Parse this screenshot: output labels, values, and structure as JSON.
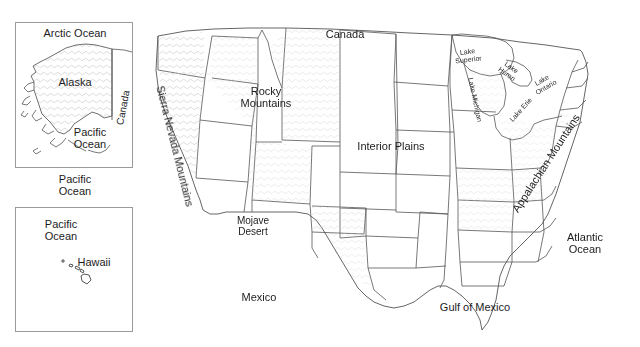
{
  "map": {
    "title": "United States Physical Features Map",
    "background_color": "#ffffff",
    "outline_color": "#4a4a4a",
    "label_color": "#1c1c1c",
    "inset_border_color": "#9a9a9a",
    "shading_color": "#cfcfcf"
  },
  "insets": {
    "alaska": {
      "name": "Alaska inset",
      "labels": {
        "arctic_ocean": "Arctic Ocean",
        "alaska": "Alaska",
        "canada": "Canada",
        "pacific_ocean": "Pacific\nOcean"
      }
    },
    "hawaii": {
      "name": "Hawaii inset",
      "labels": {
        "pacific_ocean": "Pacific\nOcean",
        "hawaii": "Hawaii"
      }
    },
    "between_label": "Pacific\nOcean"
  },
  "mainland": {
    "labels": {
      "canada": "Canada",
      "rocky_mountains": "Rocky\nMountains",
      "sierra_nevada": "Sierra Nevada Mountains",
      "interior_plains": "Interior Plains",
      "appalachian_mountains": "Appalachian Mountains",
      "mojave_desert": "Mojave\nDesert",
      "mexico": "Mexico",
      "gulf_of_mexico": "Gulf of Mexico",
      "atlantic_ocean": "Atlantic\nOcean",
      "lake_superior": "Lake\nSuperior",
      "lake_michigan": "Lake Michigan",
      "lake_huron": "Lake\nHuron",
      "lake_erie": "Lake Erie",
      "lake_ontario": "Lake\nOntario"
    }
  }
}
